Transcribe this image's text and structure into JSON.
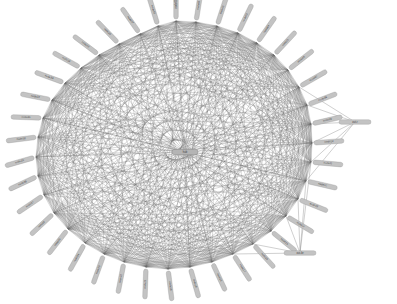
{
  "figure": {
    "kind": "network-graph",
    "title": "",
    "background_color": "#ffffff",
    "width": 397,
    "height": 304
  },
  "chart_data": {
    "type": "scatter",
    "layout": "circular",
    "title": "",
    "xlabel": "",
    "ylabel": "",
    "grid": false,
    "legend": null,
    "axis_visible": false,
    "center": {
      "x": 175,
      "y": 152
    },
    "radius_x": 137,
    "radius_y": 131,
    "node_count": 42,
    "edge_density": "near-complete",
    "node_style": {
      "shape": "rounded-capsule",
      "fill": "#c3c3c3",
      "stroke": "#8e8e8e",
      "label_color": "#3a3a3a",
      "label_orientation": "radial-outward"
    },
    "edge_style": {
      "color": "#6f6f6f",
      "width": 0.42,
      "opacity": 0.62,
      "curved": false
    },
    "nodes": [
      {
        "id": "n00",
        "label": "node00",
        "x": 176,
        "y": 21,
        "angle": -90,
        "kind": "ring"
      },
      {
        "id": "n01",
        "label": "node01",
        "x": 196,
        "y": 22,
        "angle": -81,
        "kind": "ring"
      },
      {
        "id": "n02",
        "label": "node02",
        "x": 217,
        "y": 26,
        "angle": -72,
        "kind": "ring"
      },
      {
        "id": "n03",
        "label": "node03",
        "x": 238,
        "y": 33,
        "angle": -64,
        "kind": "ring"
      },
      {
        "id": "n04",
        "label": "node04",
        "x": 257,
        "y": 43,
        "angle": -55,
        "kind": "ring"
      },
      {
        "id": "n05",
        "label": "node05",
        "x": 274,
        "y": 55,
        "angle": -47,
        "kind": "ring"
      },
      {
        "id": "n06",
        "label": "node06",
        "x": 288,
        "y": 70,
        "angle": -38,
        "kind": "ring"
      },
      {
        "id": "n07",
        "label": "node07",
        "x": 299,
        "y": 87,
        "angle": -30,
        "kind": "ring"
      },
      {
        "id": "n08",
        "label": "node08",
        "x": 307,
        "y": 105,
        "angle": -21,
        "kind": "ring"
      },
      {
        "id": "n09",
        "label": "node09",
        "x": 311,
        "y": 124,
        "angle": -13,
        "kind": "ring"
      },
      {
        "id": "n10",
        "label": "node10",
        "x": 312,
        "y": 143,
        "angle": -4,
        "kind": "ring"
      },
      {
        "id": "n11",
        "label": "node11",
        "x": 311,
        "y": 162,
        "angle": 5,
        "kind": "ring"
      },
      {
        "id": "n12",
        "label": "node12",
        "x": 306,
        "y": 181,
        "angle": 13,
        "kind": "ring"
      },
      {
        "id": "n13",
        "label": "node13",
        "x": 298,
        "y": 199,
        "angle": 22,
        "kind": "ring"
      },
      {
        "id": "n14",
        "label": "node14",
        "x": 286,
        "y": 216,
        "angle": 31,
        "kind": "ring"
      },
      {
        "id": "n15",
        "label": "node15",
        "x": 271,
        "y": 231,
        "angle": 39,
        "kind": "ring"
      },
      {
        "id": "n16",
        "label": "node16",
        "x": 253,
        "y": 244,
        "angle": 48,
        "kind": "ring"
      },
      {
        "id": "n17",
        "label": "node17",
        "x": 233,
        "y": 254,
        "angle": 57,
        "kind": "ring"
      },
      {
        "id": "n18",
        "label": "node18",
        "x": 212,
        "y": 262,
        "angle": 65,
        "kind": "ring"
      },
      {
        "id": "n19",
        "label": "node19",
        "x": 190,
        "y": 267,
        "angle": 74,
        "kind": "ring"
      },
      {
        "id": "n20",
        "label": "node20",
        "x": 168,
        "y": 269,
        "angle": 83,
        "kind": "ring"
      },
      {
        "id": "n21",
        "label": "node21",
        "x": 146,
        "y": 267,
        "angle": 92,
        "kind": "ring"
      },
      {
        "id": "n22",
        "label": "node22",
        "x": 124,
        "y": 262,
        "angle": 101,
        "kind": "ring"
      },
      {
        "id": "n23",
        "label": "node23",
        "x": 104,
        "y": 254,
        "angle": 110,
        "kind": "ring"
      },
      {
        "id": "n24",
        "label": "node24",
        "x": 85,
        "y": 243,
        "angle": 119,
        "kind": "ring"
      },
      {
        "id": "n25",
        "label": "node25",
        "x": 68,
        "y": 229,
        "angle": 128,
        "kind": "ring"
      },
      {
        "id": "n26",
        "label": "node26",
        "x": 54,
        "y": 213,
        "angle": 137,
        "kind": "ring"
      },
      {
        "id": "n27",
        "label": "node27",
        "x": 44,
        "y": 195,
        "angle": 146,
        "kind": "ring"
      },
      {
        "id": "n28",
        "label": "node28",
        "x": 38,
        "y": 176,
        "angle": 155,
        "kind": "ring"
      },
      {
        "id": "n29",
        "label": "node29",
        "x": 36,
        "y": 157,
        "angle": 164,
        "kind": "ring"
      },
      {
        "id": "n30",
        "label": "node30",
        "x": 38,
        "y": 137,
        "angle": 173,
        "kind": "ring"
      },
      {
        "id": "n31",
        "label": "node31",
        "x": 43,
        "y": 118,
        "angle": -178,
        "kind": "ring"
      },
      {
        "id": "n32",
        "label": "node32",
        "x": 52,
        "y": 100,
        "angle": -169,
        "kind": "ring"
      },
      {
        "id": "n33",
        "label": "node33",
        "x": 65,
        "y": 83,
        "angle": -160,
        "kind": "ring"
      },
      {
        "id": "n34",
        "label": "node34",
        "x": 81,
        "y": 68,
        "angle": -151,
        "kind": "ring"
      },
      {
        "id": "n35",
        "label": "node35",
        "x": 99,
        "y": 55,
        "angle": -143,
        "kind": "ring"
      },
      {
        "id": "n36",
        "label": "node36",
        "x": 119,
        "y": 44,
        "angle": -134,
        "kind": "ring"
      },
      {
        "id": "n37",
        "label": "node37",
        "x": 140,
        "y": 34,
        "angle": -125,
        "kind": "ring"
      },
      {
        "id": "n38",
        "label": "node38",
        "x": 158,
        "y": 26,
        "angle": -107,
        "kind": "ring"
      },
      {
        "id": "n39",
        "label": "hub",
        "x": 185,
        "y": 152,
        "angle": 0,
        "kind": "hub"
      },
      {
        "id": "n40",
        "label": "out-r",
        "x": 355,
        "y": 122,
        "angle": 0,
        "kind": "outlier"
      },
      {
        "id": "n41",
        "label": "out-br",
        "x": 300,
        "y": 253,
        "angle": 0,
        "kind": "outlier"
      }
    ],
    "outlier_edges": [
      [
        "n40",
        "n08"
      ],
      [
        "n40",
        "n09"
      ],
      [
        "n40",
        "n10"
      ],
      [
        "n40",
        "n11"
      ],
      [
        "n40",
        "n12"
      ],
      [
        "n40",
        "n07"
      ],
      [
        "n41",
        "n11"
      ],
      [
        "n41",
        "n12"
      ],
      [
        "n41",
        "n13"
      ],
      [
        "n41",
        "n14"
      ],
      [
        "n41",
        "n15"
      ],
      [
        "n41",
        "n16"
      ],
      [
        "n41",
        "n17"
      ]
    ]
  }
}
